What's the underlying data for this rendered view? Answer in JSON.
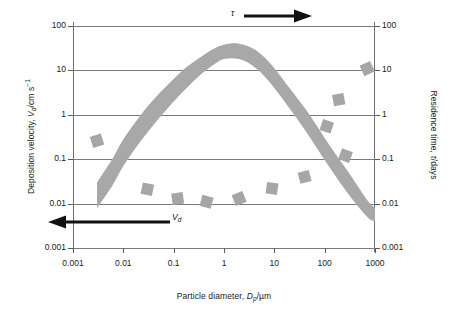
{
  "chart_data": {
    "type": "line",
    "title": "",
    "xlabel": "Particle diameter, Dp/µm",
    "ylabel": "Deposition velocity, Vd/cm s⁻¹",
    "y2label": "Residence time, τ/days",
    "xscale": "log",
    "yscale": "log",
    "xlim": [
      0.001,
      1000
    ],
    "ylim": [
      0.001,
      100
    ],
    "y2lim": [
      0.001,
      100
    ],
    "grid": "horizontal",
    "legend": "none",
    "xticks": [
      "0.001",
      "0.01",
      "0.1",
      "1",
      "10",
      "100",
      "1000"
    ],
    "xtick_values": [
      0.001,
      0.01,
      0.1,
      1,
      10,
      100,
      1000
    ],
    "yticks": [
      "100",
      "10",
      "1",
      "0.1",
      "0.01",
      "0.001"
    ],
    "ytick_values": [
      100,
      10,
      1,
      0.1,
      0.01,
      0.001
    ],
    "y2ticks": [
      "100",
      "10",
      "1",
      "0.1",
      "0.01",
      "0.001"
    ],
    "y2tick_values": [
      100,
      10,
      1,
      0.1,
      0.01,
      0.001
    ],
    "series": [
      {
        "name": "Deposition velocity band (upper bound)",
        "kind": "band-edge",
        "x": [
          0.003,
          0.006,
          0.01,
          0.02,
          0.04,
          0.08,
          0.15,
          0.3,
          0.6,
          1.0,
          2.0,
          4.0,
          8.0,
          20,
          50,
          120,
          300,
          700,
          1000
        ],
        "y": [
          0.03,
          0.1,
          0.28,
          0.85,
          2.2,
          5.0,
          10.0,
          18.0,
          30.0,
          38.0,
          40.0,
          30.0,
          15.0,
          4.0,
          1.0,
          0.22,
          0.05,
          0.012,
          0.008
        ]
      },
      {
        "name": "Deposition velocity band (lower bound)",
        "kind": "band-edge",
        "x": [
          0.003,
          0.006,
          0.01,
          0.02,
          0.04,
          0.08,
          0.15,
          0.3,
          0.6,
          1.0,
          2.0,
          4.0,
          8.0,
          20,
          50,
          120,
          300,
          700,
          1000
        ],
        "y": [
          0.008,
          0.025,
          0.07,
          0.22,
          0.6,
          1.5,
          3.2,
          7.0,
          13.0,
          18.0,
          18.0,
          12.0,
          5.5,
          1.4,
          0.32,
          0.07,
          0.016,
          0.005,
          0.004
        ]
      },
      {
        "name": "Measured data points",
        "kind": "scatter",
        "marker": "tilted-square",
        "points": [
          {
            "x": 0.003,
            "y": 0.26
          },
          {
            "x": 0.03,
            "y": 0.021
          },
          {
            "x": 0.12,
            "y": 0.013
          },
          {
            "x": 0.45,
            "y": 0.011
          },
          {
            "x": 2.0,
            "y": 0.013
          },
          {
            "x": 9.0,
            "y": 0.022
          },
          {
            "x": 40,
            "y": 0.04
          },
          {
            "x": 110,
            "y": 0.55
          },
          {
            "x": 190,
            "y": 2.2
          },
          {
            "x": 260,
            "y": 0.12
          },
          {
            "x": 700,
            "y": 11.0
          }
        ]
      }
    ],
    "annotations": [
      {
        "text": "τ",
        "arrow": "right",
        "position": "top-right",
        "refers_to": "Residence time, right axis"
      },
      {
        "text": "Vd",
        "arrow": "left",
        "position": "bottom-left",
        "refers_to": "Deposition velocity, left axis"
      }
    ]
  },
  "axes": {
    "y_left": {
      "title_prefix": "Deposition velocity, ",
      "title_var": "V",
      "title_sub": "d",
      "title_unit": "/cm s",
      "title_sup": "−1",
      "ticks": [
        "100",
        "10",
        "1",
        "0.1",
        "0.01",
        "0.001"
      ]
    },
    "y_right": {
      "title_prefix": "Residence time, ",
      "title_var": "τ",
      "title_unit": "/days",
      "ticks": [
        "100",
        "10",
        "1",
        "0.1",
        "0.01",
        "0.001"
      ]
    },
    "x": {
      "title_prefix": "Particle diameter, ",
      "title_var": "D",
      "title_sub": "p",
      "title_unit": "/µm",
      "ticks": [
        "0.001",
        "0.01",
        "0.1",
        "1",
        "10",
        "100",
        "1000"
      ]
    }
  },
  "annotations": {
    "tau_label": "τ",
    "vd_label_var": "V",
    "vd_label_sub": "d"
  },
  "colors": {
    "band_gray": "#a8a8a8",
    "marker_gray": "#a6a6a6",
    "gridline": "#7a7a7a",
    "axis": "#6e6e6e",
    "arrow": "#111111",
    "text": "#1a1a1a",
    "background": "#ffffff"
  }
}
